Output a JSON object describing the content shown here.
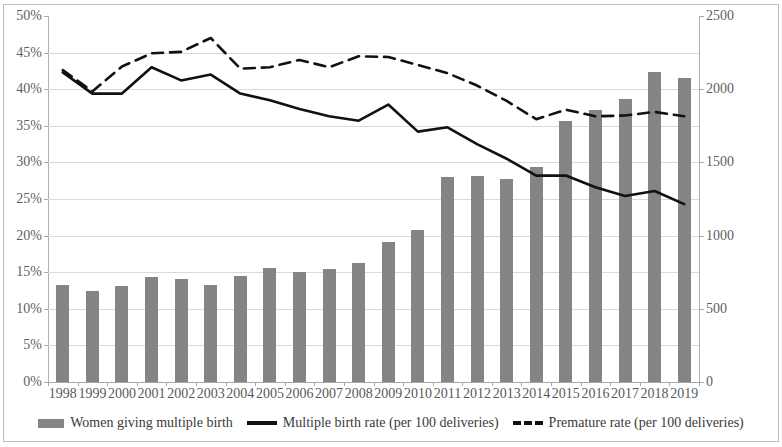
{
  "chart_data": {
    "type": "bar",
    "title": "",
    "subtitle": "",
    "xlabel": "",
    "ylabel": "",
    "y2label": "",
    "grid": true,
    "legend_position": "bottom",
    "categories": [
      "1998",
      "1999",
      "2000",
      "2001",
      "2002",
      "2003",
      "2004",
      "2005",
      "2006",
      "2007",
      "2008",
      "2009",
      "2010",
      "2011",
      "2012",
      "2013",
      "2014",
      "2015",
      "2016",
      "2017",
      "2018",
      "2019"
    ],
    "left_axis": {
      "ticks": [
        "0%",
        "5%",
        "10%",
        "15%",
        "20%",
        "25%",
        "30%",
        "35%",
        "40%",
        "45%",
        "50%"
      ],
      "tick_values": [
        0,
        5,
        10,
        15,
        20,
        25,
        30,
        35,
        40,
        45,
        50
      ],
      "min": 0,
      "max": 50,
      "unit": "%"
    },
    "right_axis": {
      "ticks": [
        "0",
        "500",
        "1000",
        "1500",
        "2000",
        "2500"
      ],
      "tick_values": [
        0,
        500,
        1000,
        1500,
        2000,
        2500
      ],
      "min": 0,
      "max": 2500
    },
    "series": [
      {
        "name": "Women giving multiple birth",
        "type": "bar",
        "axis": "right",
        "color": "#848484",
        "values": [
          660,
          625,
          655,
          715,
          705,
          660,
          725,
          780,
          750,
          770,
          810,
          955,
          1040,
          1400,
          1405,
          1385,
          1470,
          1780,
          1855,
          1930,
          2115,
          2075
        ]
      },
      {
        "name": "Multiple birth rate (per 100 deliveries)",
        "type": "line",
        "style": "solid",
        "axis": "left",
        "color": "#111111",
        "values": [
          42.3,
          39.4,
          39.4,
          43.0,
          41.2,
          42.0,
          39.4,
          38.5,
          37.3,
          36.3,
          35.7,
          37.9,
          34.2,
          34.8,
          32.5,
          30.5,
          28.2,
          28.2,
          26.6,
          25.4,
          26.1,
          24.3
        ]
      },
      {
        "name": "Premature rate (per 100 deliveries)",
        "type": "line",
        "style": "dashed",
        "axis": "left",
        "color": "#111111",
        "values": [
          42.6,
          39.7,
          43.1,
          44.9,
          45.1,
          47.0,
          42.8,
          43.0,
          44.0,
          43.0,
          44.5,
          44.4,
          43.3,
          42.2,
          40.5,
          38.4,
          35.9,
          37.2,
          36.3,
          36.4,
          36.9,
          36.3
        ]
      }
    ]
  },
  "legend": {
    "items": [
      {
        "label": "Women giving multiple birth",
        "marker": "bar-swatch"
      },
      {
        "label": "Multiple birth rate (per 100 deliveries)",
        "marker": "solid-line-swatch"
      },
      {
        "label": "Premature rate (per 100 deliveries)",
        "marker": "dashed-line-swatch"
      }
    ]
  }
}
